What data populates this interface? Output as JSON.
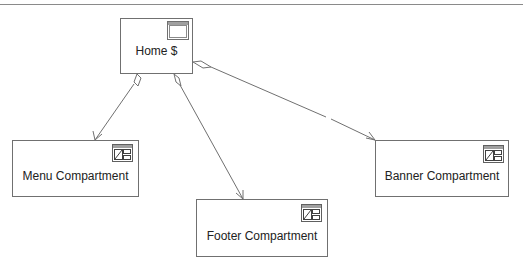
{
  "diagram": {
    "colors": {
      "stroke": "#707070",
      "text": "#222222",
      "icon_fill": "#a0a0a0"
    },
    "nodes": [
      {
        "id": "home",
        "label": "Home $",
        "icon": "window-icon"
      },
      {
        "id": "menu",
        "label": "Menu Compartment",
        "icon": "compartment-icon"
      },
      {
        "id": "footer",
        "label": "Footer Compartment",
        "icon": "compartment-icon"
      },
      {
        "id": "banner",
        "label": "Banner Compartment",
        "icon": "compartment-icon"
      }
    ],
    "edges": [
      {
        "from": "home",
        "to": "menu",
        "type": "aggregation-arrow"
      },
      {
        "from": "home",
        "to": "footer",
        "type": "aggregation-arrow"
      },
      {
        "from": "home",
        "to": "banner",
        "type": "aggregation-arrow"
      }
    ]
  }
}
